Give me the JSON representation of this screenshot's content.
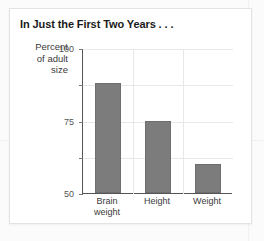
{
  "card": {
    "title": "In Just the First Two Years . . ."
  },
  "colors": {
    "bar": "#7c7c7c",
    "axis": "#555555",
    "grid": "#e8e8e8",
    "title_text": "#1a1a1a",
    "label_text": "#3a3a3a",
    "card_bg": "#ffffff",
    "page_bg": "#fbfbfb"
  },
  "chart_data": {
    "type": "bar",
    "title": "In Just the First Two Years . . .",
    "xlabel": "",
    "ylabel": "Percent of adult size",
    "ylabel_lines": [
      "Percent",
      "of adult",
      "size"
    ],
    "categories": [
      "Brain weight",
      "Height",
      "Weight"
    ],
    "category_lines": [
      [
        "Brain",
        "weight"
      ],
      [
        "Height"
      ],
      [
        "Weight"
      ]
    ],
    "values": [
      76,
      50,
      20
    ],
    "ylim": [
      0,
      100
    ],
    "yticks": [
      0,
      25,
      50,
      75,
      100
    ],
    "ytick_labels": [
      "0",
      "25",
      "50",
      "75",
      "100"
    ],
    "grid": true,
    "legend": "none",
    "series_color": "#7c7c7c"
  }
}
